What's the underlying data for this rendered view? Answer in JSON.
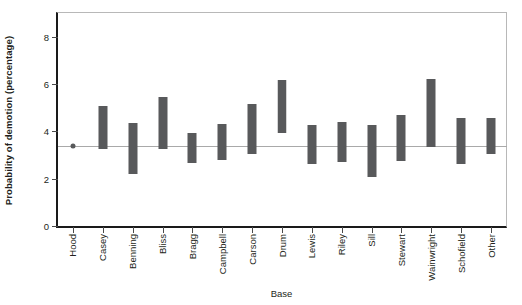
{
  "chart_data": {
    "type": "bar",
    "chart_style": "floating-range-bars",
    "title": "",
    "xlabel": "Base",
    "ylabel": "Probability of demotion (percentage)",
    "ylim": [
      0,
      9
    ],
    "yticks": [
      0,
      2,
      4,
      6,
      8
    ],
    "ytick_labels": [
      "0",
      "2",
      "4",
      "6",
      "8"
    ],
    "grid": false,
    "legend": null,
    "reference_line": {
      "value": 3.4,
      "label": "",
      "color": "#a9a9a9"
    },
    "bar_color": "#58595b",
    "categories": [
      "Hood",
      "Casey",
      "Benning",
      "Bliss",
      "Bragg",
      "Campbell",
      "Carson",
      "Drum",
      "Lewis",
      "Riley",
      "Sill",
      "Stewart",
      "Wainwright",
      "Schofield",
      "Other"
    ],
    "series": [
      {
        "name": "lower",
        "values": [
          3.4,
          3.25,
          2.2,
          3.25,
          2.65,
          2.8,
          3.05,
          3.95,
          2.6,
          2.7,
          2.05,
          2.75,
          3.35,
          2.6,
          3.05
        ]
      },
      {
        "name": "upper",
        "values": [
          3.4,
          5.05,
          4.35,
          5.45,
          3.95,
          4.3,
          5.15,
          6.15,
          4.25,
          4.4,
          4.25,
          4.7,
          6.2,
          4.55,
          4.55
        ]
      }
    ],
    "reference_point": {
      "category": "Hood",
      "value": 3.4
    },
    "highlighted_category": "Drum",
    "annotations": []
  }
}
